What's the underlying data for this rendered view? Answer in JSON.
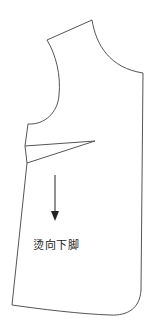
{
  "diagram": {
    "type": "garment-pattern",
    "annotation": "烫向下脚",
    "colors": {
      "stroke": "#555555",
      "arrow": "#222222",
      "text": "#222222",
      "background": "#ffffff"
    }
  }
}
